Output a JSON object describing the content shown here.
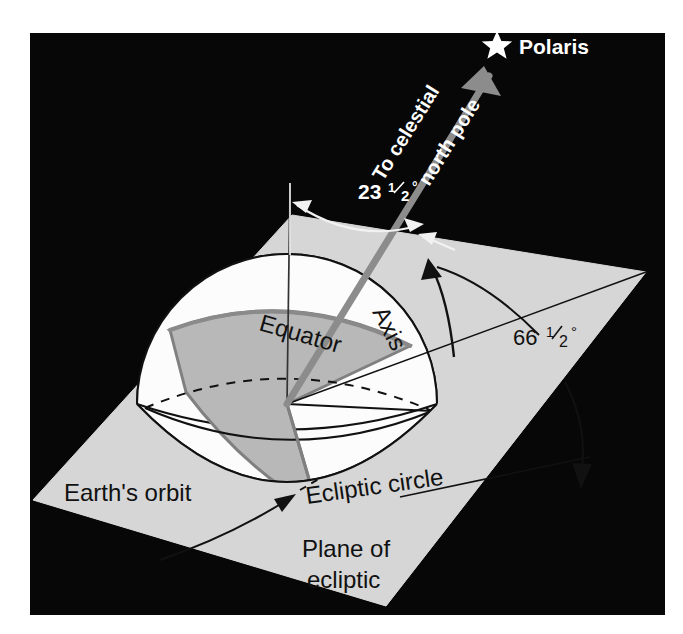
{
  "figure": {
    "type": "astronomy-diagram",
    "background_color": "#000000",
    "page_color": "#ffffff",
    "plane_color": "#d5d5d5",
    "sphere_light_color": "#fbfbfb",
    "sphere_shaded_color": "#b9b9b9",
    "axis_color": "#808080",
    "line_color": "#000000",
    "label_light_color": "#ffffff"
  },
  "labels": {
    "polaris": "Polaris",
    "to_celestial_line1": "To celestial",
    "to_celestial_line2": "north pole",
    "tilt_angle": "23 1/2°",
    "tilt_angle_whole": "23",
    "tilt_angle_fraction_num": "1",
    "tilt_angle_fraction_den": "2",
    "tilt_angle_degree": "°",
    "plane_angle": "66 1/2°",
    "plane_angle_whole": "66",
    "plane_angle_fraction_num": "1",
    "plane_angle_fraction_den": "2",
    "plane_angle_degree": "°",
    "equator": "Equator",
    "axis": "Axis",
    "ecliptic_circle": "Ecliptic circle",
    "earths_orbit": "Earth's orbit",
    "plane_of_ecliptic_line1": "Plane of",
    "plane_of_ecliptic_line2": "ecliptic"
  },
  "icons": {
    "star": "star-icon",
    "axis_arrow": "axis-arrow-icon",
    "tilt_arc_arrow": "tilt-angle-double-arrow-icon",
    "plane_arc_arrow": "plane-angle-arc-arrow-icon",
    "orbit_pointer": "earths-orbit-pointer-arrow-icon"
  },
  "geometry": {
    "frame": {
      "x": 30,
      "y": 33,
      "width": 635,
      "height": 582
    },
    "plane_corners": {
      "top": [
        292,
        215
      ],
      "right": [
        646,
        272
      ],
      "bottom": [
        386,
        606
      ],
      "left": [
        33,
        500
      ]
    },
    "sphere_center": [
      287,
      404
    ],
    "sphere_radius": 150,
    "axis_start": [
      287,
      404
    ],
    "axis_tip": [
      484,
      70
    ],
    "star_position": [
      497,
      46
    ],
    "vertical_line_top": [
      290,
      183
    ],
    "vertical_line_bottom": [
      287,
      404
    ]
  }
}
